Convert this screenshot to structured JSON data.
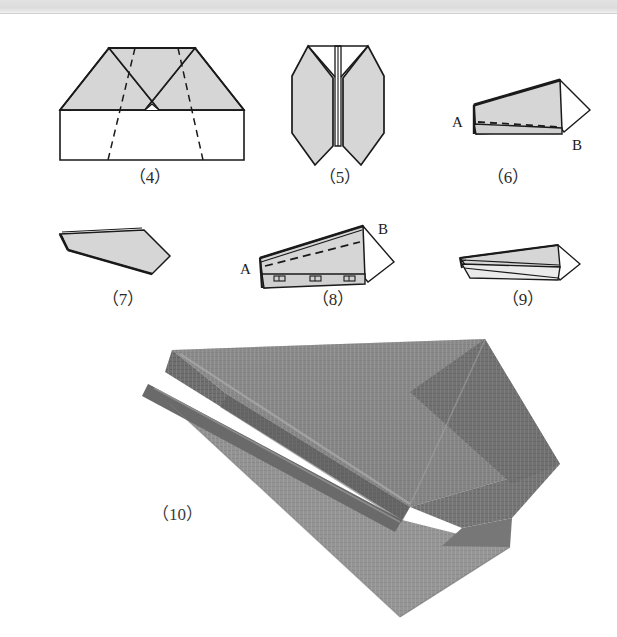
{
  "page": {
    "kind": "origami-instruction-page",
    "background_color": "#ffffff",
    "scan_band_color": "#dcdcdc",
    "paper_fill_color": "#d6d6d6",
    "line_color": "#1a1a1a",
    "photo_gray": "#8a8a8a"
  },
  "steps": [
    {
      "id": "step-4",
      "caption": "（4）",
      "number": "4",
      "description": "Trapezoid sheet with upper corners folded in to meet at centre; dashed fold guide lines cross the lower rectangle."
    },
    {
      "id": "step-5",
      "caption": "（5）",
      "number": "5",
      "description": "Symmetric two-legged shape with a central vertical crease, the two wing flaps splayed downward."
    },
    {
      "id": "step-6",
      "caption": "（6）",
      "number": "6",
      "description": "Folded wedge seen from the side, labelled A at the left tip and B at the lower right; a dashed fold line runs from A to B.",
      "labels": [
        {
          "text": "A",
          "position": "left"
        },
        {
          "text": "B",
          "position": "right"
        }
      ]
    },
    {
      "id": "step-7",
      "caption": "（7）",
      "number": "7",
      "description": "Flat arrow-head shaped body after folding, pointed tip at the left."
    },
    {
      "id": "step-8",
      "caption": "（8）",
      "number": "8",
      "description": "Wedge with label A at the left and B at the upper right; dashed line from A to B and small clip marks along the bottom edge.",
      "labels": [
        {
          "text": "A",
          "position": "left"
        },
        {
          "text": "B",
          "position": "right"
        }
      ]
    },
    {
      "id": "step-9",
      "caption": "（9）",
      "number": "9",
      "description": "Finished plane drawn in perspective with the two wings spread open."
    },
    {
      "id": "step-10",
      "caption": "（10）",
      "number": "10",
      "description": "Photograph of the completed grey paper dart plane in three-quarter view."
    }
  ]
}
